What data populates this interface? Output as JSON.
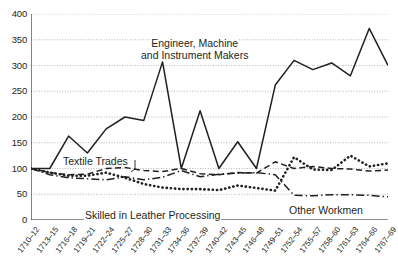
{
  "chart_data": {
    "type": "line",
    "title": "",
    "subtitle": "",
    "xlabel": "",
    "ylabel": "",
    "xlim": [
      0,
      19
    ],
    "ylim": [
      0,
      400
    ],
    "grid": true,
    "legend_position": "inline-annotations",
    "y_ticks": [
      0,
      50,
      100,
      150,
      200,
      250,
      300,
      350,
      400
    ],
    "y_tick_labels": [
      "0",
      "50",
      "100",
      "150",
      "200",
      "250",
      "300",
      "350",
      "400"
    ],
    "categories": [
      "1710–12",
      "1713–15",
      "1716–18",
      "1719–21",
      "1722–24",
      "1725–27",
      "1728–30",
      "1731–33",
      "1734–36",
      "1737–39",
      "1740–42",
      "1743–45",
      "1746–48",
      "1749–51",
      "1752–54",
      "1755–57",
      "1758–60",
      "1761–63",
      "1764–66",
      "1767–69"
    ],
    "series": [
      {
        "name": "Engineer, Machine and Instrument Makers",
        "style": "solid",
        "color": "#231f20",
        "values": [
          100,
          100,
          163,
          130,
          177,
          200,
          193,
          307,
          100,
          212,
          100,
          152,
          100,
          262,
          310,
          292,
          305,
          280,
          372,
          300
        ]
      },
      {
        "name": "Textile Trades",
        "style": "dashed",
        "color": "#231f20",
        "values": [
          100,
          92,
          88,
          89,
          100,
          102,
          96,
          94,
          100,
          90,
          88,
          92,
          91,
          113,
          100,
          104,
          100,
          99,
          95,
          97
        ]
      },
      {
        "name": "Skilled in Leather Processing",
        "style": "dotted",
        "color": "#231f20",
        "values": [
          100,
          92,
          86,
          86,
          92,
          82,
          70,
          63,
          60,
          60,
          58,
          67,
          62,
          57,
          122,
          98,
          97,
          125,
          104,
          110
        ]
      },
      {
        "name": "Other Workmen",
        "style": "dashdot",
        "color": "#231f20",
        "values": [
          100,
          88,
          82,
          80,
          78,
          84,
          78,
          83,
          96,
          84,
          89,
          91,
          92,
          88,
          48,
          47,
          49,
          49,
          48,
          45
        ]
      }
    ],
    "annotations": [
      {
        "id": "engineer",
        "line1": "Engineer, Machine",
        "line2": "and Instrument Makers"
      },
      {
        "id": "textile",
        "text": "Textile Trades"
      },
      {
        "id": "leather",
        "text": "Skilled in Leather Processing"
      },
      {
        "id": "other",
        "text": "Other Workmen"
      }
    ]
  }
}
